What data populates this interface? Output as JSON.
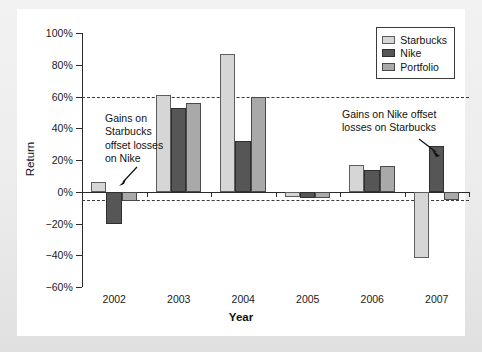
{
  "chart_data": {
    "type": "bar",
    "title": "",
    "xlabel": "Year",
    "ylabel": "Return",
    "categories": [
      "2002",
      "2003",
      "2004",
      "2005",
      "2006",
      "2007"
    ],
    "series": [
      {
        "name": "Starbucks",
        "color": "#d6d6d6",
        "values": [
          6,
          61,
          87,
          -3,
          17,
          -42
        ]
      },
      {
        "name": "Nike",
        "color": "#565656",
        "values": [
          -20,
          53,
          32,
          -4,
          14,
          29
        ]
      },
      {
        "name": "Portfolio",
        "color": "#a9a9a9",
        "values": [
          -6,
          56,
          60,
          -4,
          16,
          -5
        ]
      }
    ],
    "ylim": [
      -60,
      100
    ],
    "ytick_step": 20,
    "ytick_labels": [
      "100%",
      "80%",
      "60%",
      "40%",
      "20%",
      "0%",
      "-20%",
      "-40%",
      "-60%"
    ],
    "ytick_values": [
      100,
      80,
      60,
      40,
      20,
      0,
      -20,
      -40,
      -60
    ],
    "reference_lines": [
      {
        "value": 60,
        "style": "dashed"
      },
      {
        "value": -5,
        "style": "dashed"
      }
    ],
    "grid": false,
    "legend_position": "top-right",
    "annotations": [
      {
        "text": "Gains on\nStarbucks\noffset losses\non Nike",
        "target": "2002 Starbucks bar"
      },
      {
        "text": "Gains on Nike offset\nlosses on Starbucks",
        "target": "2007 Nike bar"
      }
    ]
  },
  "legend": {
    "items": [
      {
        "label": "Starbucks"
      },
      {
        "label": "Nike"
      },
      {
        "label": "Portfolio"
      }
    ]
  },
  "axes": {
    "y_title": "Return",
    "x_title": "Year"
  },
  "annotations": {
    "left": "Gains on\nStarbucks\noffset losses\non Nike",
    "right": "Gains on Nike offset\nlosses on Starbucks"
  }
}
